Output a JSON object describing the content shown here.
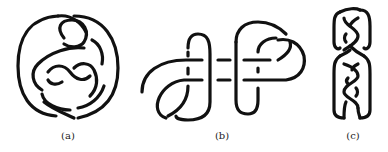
{
  "figure": {
    "panels": [
      {
        "id": "a",
        "label": "(a)",
        "description": "knot diagram enclosed in oval loop"
      },
      {
        "id": "b",
        "label": "(b)",
        "description": "two linked curl loops connected by horizontal strands"
      },
      {
        "id": "c",
        "label": "(c)",
        "description": "vertical braided knot diagram"
      }
    ],
    "stroke_color": "#111111",
    "background": "#ffffff"
  }
}
